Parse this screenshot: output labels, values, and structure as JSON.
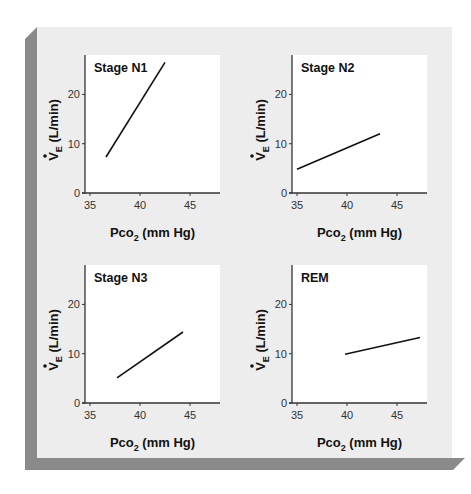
{
  "figure": {
    "colors": {
      "frame": "#ededed",
      "frame_shadow": "#8a8a8a",
      "plot_bg": "#ffffff",
      "line": "#111111"
    }
  },
  "chart_data": [
    {
      "type": "line",
      "title": "Stage N1",
      "xlabel": "Pco2 (mm Hg)",
      "ylabel": "V̇E (L/min)",
      "xlim": [
        34.5,
        48
      ],
      "ylim": [
        0,
        28
      ],
      "xticks": [
        35,
        40,
        45
      ],
      "yticks": [
        0,
        10,
        20
      ],
      "grid": false,
      "series": [
        {
          "name": "Stage N1",
          "x": [
            36.6,
            42.5
          ],
          "y": [
            7.3,
            26.5
          ]
        }
      ]
    },
    {
      "type": "line",
      "title": "Stage N2",
      "xlabel": "Pco2 (mm Hg)",
      "ylabel": "V̇E (L/min)",
      "xlim": [
        34.5,
        48
      ],
      "ylim": [
        0,
        28
      ],
      "xticks": [
        35,
        40,
        45
      ],
      "yticks": [
        0,
        10,
        20
      ],
      "grid": false,
      "series": [
        {
          "name": "Stage N2",
          "x": [
            35.0,
            43.3
          ],
          "y": [
            4.8,
            12.0
          ]
        }
      ]
    },
    {
      "type": "line",
      "title": "Stage N3",
      "xlabel": "Pco2 (mm Hg)",
      "ylabel": "V̇E (L/min)",
      "xlim": [
        34.5,
        48
      ],
      "ylim": [
        0,
        28
      ],
      "xticks": [
        35,
        40,
        45
      ],
      "yticks": [
        0,
        10,
        20
      ],
      "grid": false,
      "series": [
        {
          "name": "Stage N3",
          "x": [
            37.7,
            44.3
          ],
          "y": [
            5.1,
            14.4
          ]
        }
      ]
    },
    {
      "type": "line",
      "title": "REM",
      "xlabel": "Pco2 (mm Hg)",
      "ylabel": "V̇E (L/min)",
      "xlim": [
        34.5,
        48
      ],
      "ylim": [
        0,
        28
      ],
      "xticks": [
        35,
        40,
        45
      ],
      "yticks": [
        0,
        10,
        20
      ],
      "grid": false,
      "series": [
        {
          "name": "REM",
          "x": [
            39.8,
            47.3
          ],
          "y": [
            9.9,
            13.3
          ]
        }
      ]
    }
  ],
  "panels": [
    {
      "title": "Stage N1",
      "xlabel_main": "Pco",
      "xlabel_sub": "2",
      "xlabel_rest": " (mm Hg)",
      "ylabel_main": "V",
      "ylabel_sub": "E",
      "ylabel_rest": " (L/min)"
    },
    {
      "title": "Stage N2",
      "xlabel_main": "Pco",
      "xlabel_sub": "2",
      "xlabel_rest": " (mm Hg)",
      "ylabel_main": "V",
      "ylabel_sub": "E",
      "ylabel_rest": " (L/min)"
    },
    {
      "title": "Stage N3",
      "xlabel_main": "Pco",
      "xlabel_sub": "2",
      "xlabel_rest": " (mm Hg)",
      "ylabel_main": "V",
      "ylabel_sub": "E",
      "ylabel_rest": " (L/min)"
    },
    {
      "title": "REM",
      "xlabel_main": "Pco",
      "xlabel_sub": "2",
      "xlabel_rest": " (mm Hg)",
      "ylabel_main": "V",
      "ylabel_sub": "E",
      "ylabel_rest": " (L/min)"
    }
  ]
}
